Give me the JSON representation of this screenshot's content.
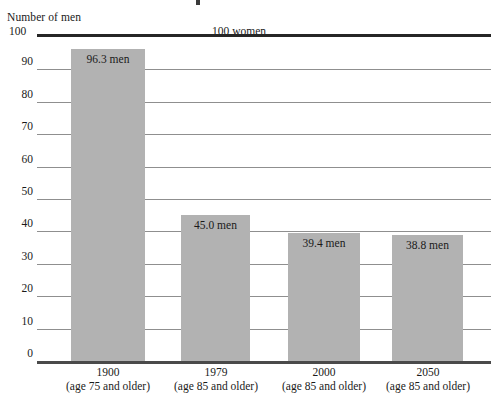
{
  "chart_data": {
    "type": "bar",
    "title": "",
    "ylabel": "Number of men",
    "xlabel": "",
    "reference_label": "100 women",
    "top_axis_value": "100",
    "ylim": [
      0,
      100
    ],
    "ytick_step": 10,
    "grid": true,
    "legend": "none",
    "bar_color": "#b2b2b2",
    "categories": [
      {
        "year": "1900",
        "sub": "(age 75 and older)"
      },
      {
        "year": "1979",
        "sub": "(age 85 and older)"
      },
      {
        "year": "2000",
        "sub": "(age 85 and older)"
      },
      {
        "year": "2050",
        "sub": "(age 85 and older)"
      }
    ],
    "values": [
      96.3,
      45.0,
      39.4,
      38.8
    ],
    "value_labels": [
      "96.3 men",
      "45.0 men",
      "39.4 men",
      "38.8 men"
    ],
    "yticks": [
      "100",
      "90",
      "80",
      "70",
      "60",
      "50",
      "40",
      "30",
      "20",
      "10",
      "0"
    ]
  }
}
